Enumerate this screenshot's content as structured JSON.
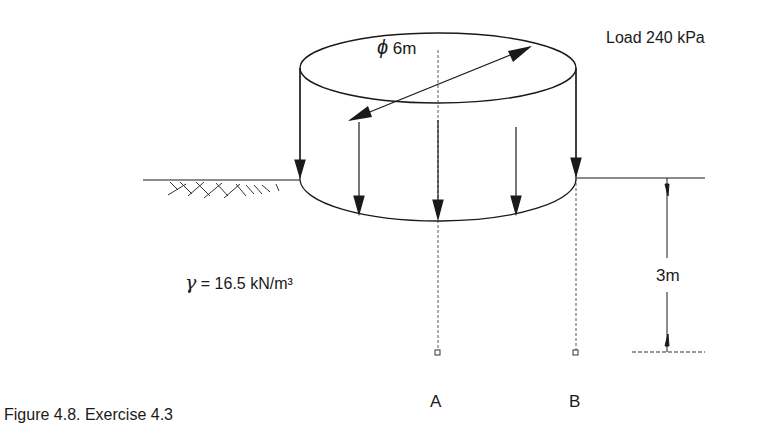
{
  "figure": {
    "caption": "Figure 4.8. Exercise 4.3",
    "load_label": "Load 240 kPa",
    "diameter_label": "6m",
    "diameter_symbol": "ϕ",
    "unit_weight_symbol": "γ",
    "unit_weight_label": "= 16.5 kN/m³",
    "depth_label": "3m",
    "point_a_label": "A",
    "point_b_label": "B"
  },
  "colors": {
    "line": "#1a1a1a",
    "background": "#ffffff"
  }
}
